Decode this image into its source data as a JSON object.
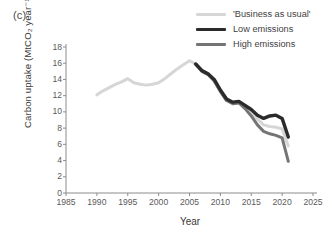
{
  "panel": {
    "label": "(c)"
  },
  "legend": {
    "position": "top-right",
    "entries": [
      {
        "label": "'Business as usual'",
        "color": "#d6d6d6",
        "width": 3.0
      },
      {
        "label": "Low emissions",
        "color": "#2b2b2b",
        "width": 3.4
      },
      {
        "label": "High emissions",
        "color": "#757575",
        "width": 3.0
      }
    ]
  },
  "axes": {
    "xlabel": "Year",
    "ylabel": "Carbon uptake (MtCO₂ year⁻¹)",
    "xticks": [
      1985,
      1990,
      1995,
      2000,
      2005,
      2010,
      2015,
      2020,
      2025
    ],
    "yticks": [
      0,
      2,
      4,
      6,
      8,
      10,
      12,
      14,
      16,
      18
    ],
    "xlim": [
      1985,
      2025
    ],
    "ylim": [
      0,
      18
    ],
    "grid": false
  },
  "chart_data": {
    "type": "line",
    "title": "",
    "xlabel": "Year",
    "ylabel": "Carbon uptake (MtCO2 year-1)",
    "xlim": [
      1985,
      2025
    ],
    "ylim": [
      0,
      18
    ],
    "xticks": [
      1985,
      1990,
      1995,
      2000,
      2005,
      2010,
      2015,
      2020,
      2025
    ],
    "yticks": [
      0,
      2,
      4,
      6,
      8,
      10,
      12,
      14,
      16,
      18
    ],
    "grid": false,
    "legend_position": "top-right",
    "series": [
      {
        "name": "'Business as usual'",
        "color": "#d6d6d6",
        "x": [
          1990,
          1991,
          1992,
          1993,
          1994,
          1995,
          1996,
          1997,
          1998,
          1999,
          2000,
          2001,
          2002,
          2003,
          2004,
          2005,
          2006,
          2007,
          2008,
          2009,
          2010,
          2011,
          2012,
          2013,
          2014,
          2015,
          2016,
          2017,
          2018,
          2019,
          2020,
          2021
        ],
        "y": [
          12.1,
          12.6,
          13.0,
          13.4,
          13.7,
          14.1,
          13.6,
          13.4,
          13.3,
          13.4,
          13.6,
          14.1,
          14.7,
          15.3,
          15.8,
          16.3,
          15.9,
          15.0,
          14.6,
          13.9,
          12.6,
          11.5,
          11.1,
          11.2,
          10.7,
          10.0,
          9.1,
          8.4,
          8.2,
          8.1,
          7.9,
          5.8
        ]
      },
      {
        "name": "Low emissions",
        "color": "#2b2b2b",
        "x": [
          2006,
          2007,
          2008,
          2009,
          2010,
          2011,
          2012,
          2013,
          2014,
          2015,
          2016,
          2017,
          2018,
          2019,
          2020,
          2021
        ],
        "y": [
          15.9,
          15.1,
          14.7,
          14.0,
          12.7,
          11.6,
          11.2,
          11.3,
          10.8,
          10.3,
          9.6,
          9.2,
          9.5,
          9.6,
          9.2,
          6.9
        ]
      },
      {
        "name": "High emissions",
        "color": "#757575",
        "x": [
          2006,
          2007,
          2008,
          2009,
          2010,
          2011,
          2012,
          2013,
          2014,
          2015,
          2016,
          2017,
          2018,
          2019,
          2020,
          2021
        ],
        "y": [
          15.9,
          15.0,
          14.6,
          13.8,
          12.5,
          11.4,
          11.0,
          11.1,
          10.4,
          9.5,
          8.4,
          7.6,
          7.3,
          7.1,
          6.8,
          3.9
        ]
      }
    ]
  }
}
